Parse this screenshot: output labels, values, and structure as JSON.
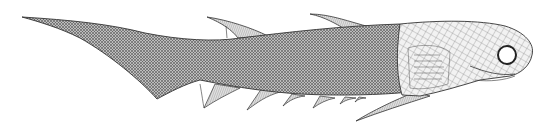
{
  "figure": {
    "subject": "Fossil acanthodian fish reconstruction, lateral view",
    "colors": {
      "background": "#ffffff",
      "outline": "#333333",
      "body_fill": "#9a9a9a",
      "fin_fill": "#c8c8c8",
      "head_fill": "#e6e6e6",
      "eye_fill": "#ffffff"
    }
  }
}
